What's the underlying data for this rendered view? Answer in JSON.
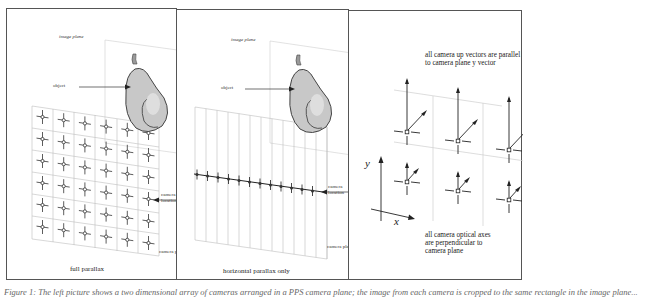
{
  "figure": {
    "panels": [
      {
        "id": "full-parallax",
        "title": "full parallax",
        "labels": {
          "image_plane": "image plane",
          "object": "object",
          "camera_location": [
            "camera",
            "location"
          ],
          "camera_plane": "camera plane"
        },
        "grid": {
          "rows": 6,
          "cols": 6
        }
      },
      {
        "id": "horizontal-parallax",
        "title": "horizontal parallax only",
        "labels": {
          "image_plane": "image plane",
          "object": "object",
          "camera_location": [
            "camera",
            "location"
          ],
          "camera_plane": "camera plane"
        },
        "camera_count": 12
      },
      {
        "id": "camera-orientation",
        "top_note": [
          "all camera up vectors  are parallel",
          "to camera plane y vector"
        ],
        "bottom_note": [
          "all camera optical axes",
          "are perpendicular to",
          "camera plane"
        ],
        "axis_labels": {
          "x": "x",
          "y": "y"
        },
        "grid": {
          "rows": 2,
          "cols": 3
        }
      }
    ],
    "caption": "Figure 1: The left picture shows a two dimensional array of cameras arranged in a PPS camera plane; the image from each camera is cropped to the same rectangle in the image plane..."
  }
}
